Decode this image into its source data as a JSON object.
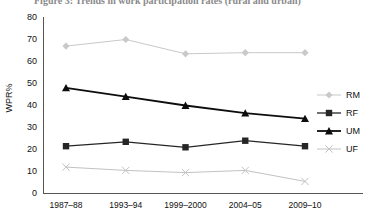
{
  "title": "Figure 3: Trends in work participation rates (rural and urban)",
  "chart_data": {
    "type": "line",
    "title": "Figure 3: Trends in work participation rates (rural and urban)",
    "xlabel": "",
    "ylabel": "WPR%",
    "ylim": [
      0,
      80
    ],
    "ytick_step": 10,
    "yticks": [
      "0",
      "10",
      "20",
      "30",
      "40",
      "50",
      "60",
      "70",
      "80"
    ],
    "grid": false,
    "legend_position": "right",
    "categories": [
      "1987–88",
      "1993–94",
      "1999–2000",
      "2004–05",
      "2009–10"
    ],
    "series": [
      {
        "name": "RM",
        "marker": "diamond",
        "color": "#c9c9c9",
        "values": [
          67,
          70,
          63.5,
          64,
          64
        ]
      },
      {
        "name": "RF",
        "marker": "square",
        "color": "#262626",
        "values": [
          21.5,
          23.5,
          21,
          24,
          21.5
        ]
      },
      {
        "name": "UM",
        "marker": "triangle",
        "color": "#0d0d0d",
        "values": [
          48,
          44,
          40,
          36.5,
          34
        ]
      },
      {
        "name": "UF",
        "marker": "x",
        "color": "#c2c2c2",
        "values": [
          12,
          10.5,
          9.5,
          10.5,
          5.5
        ]
      }
    ]
  },
  "legend": {
    "items": [
      {
        "label": "RM"
      },
      {
        "label": "RF"
      },
      {
        "label": "UM"
      },
      {
        "label": "UF"
      }
    ]
  },
  "colors": {
    "axis": "#555555",
    "text": "#111111",
    "series_light": "#c9c9c9",
    "series_dark": "#121212"
  }
}
